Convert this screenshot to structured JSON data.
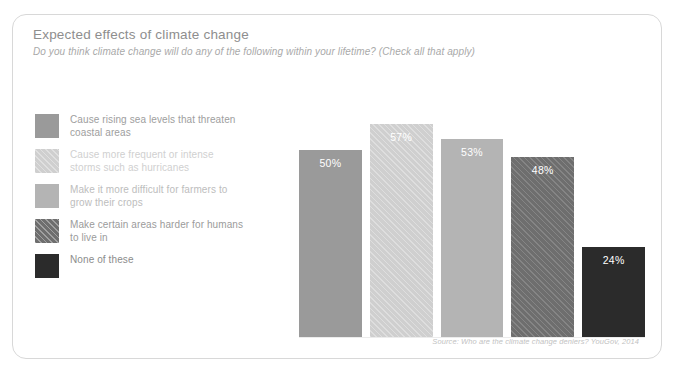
{
  "header": {
    "title": "Expected effects of climate change",
    "subtitle": "Do you think climate change will do any of the following within your lifetime? (Check all that apply)"
  },
  "legend": {
    "items": [
      {
        "label": "Cause rising sea levels that threaten coastal areas",
        "color": "#9a9a9a",
        "pattern": "solid",
        "text_color": "#9e9e9e"
      },
      {
        "label": "Cause more frequent or intense storms such as hurricanes",
        "color": "#cfcfcf",
        "pattern": "hatch",
        "text_color": "#d0d0d0"
      },
      {
        "label": "Make it more difficult for farmers to grow their crops",
        "color": "#b4b4b4",
        "pattern": "solid",
        "text_color": "#bdbdbd"
      },
      {
        "label": "Make certain areas harder for humans to live in",
        "color": "#6e6e6e",
        "pattern": "hatch",
        "text_color": "#9b9b9b"
      },
      {
        "label": "None of these",
        "color": "#2b2b2b",
        "pattern": "solid",
        "text_color": "#8c8c8c"
      }
    ]
  },
  "footer": {
    "source": "Source: Who are the climate change deniers? YouGov, 2014"
  },
  "chart_data": {
    "type": "bar",
    "title": "Expected effects of climate change",
    "subtitle": "Do you think climate change will do any of the following within your lifetime? (Check all that apply)",
    "xlabel": "",
    "ylabel": "",
    "ylim": [
      0,
      70
    ],
    "grid": false,
    "legend_position": "left",
    "categories": [
      "Cause rising sea levels that threaten coastal areas",
      "Cause more frequent or intense storms such as hurricanes",
      "Make it more difficult for farmers to grow their crops",
      "Make certain areas harder for humans to live in",
      "None of these"
    ],
    "values": [
      50,
      57,
      53,
      48,
      24
    ],
    "value_labels": [
      "50%",
      "57%",
      "53%",
      "48%",
      "24%"
    ],
    "colors": [
      "#9a9a9a",
      "#cfcfcf",
      "#b4b4b4",
      "#6e6e6e",
      "#2b2b2b"
    ],
    "patterns": [
      "solid",
      "hatch",
      "solid",
      "hatch",
      "solid"
    ],
    "source": "Source: Who are the climate change deniers? YouGov, 2014"
  }
}
